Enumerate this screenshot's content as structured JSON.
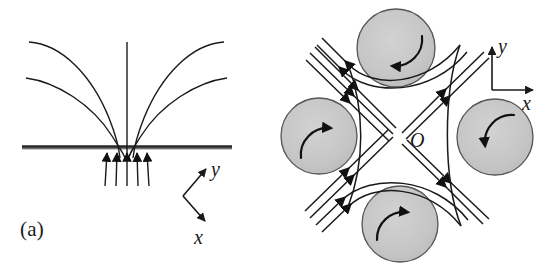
{
  "figure": {
    "panels": [
      {
        "id": "a",
        "caption": "(a)",
        "description": "Converging field lines onto a planar surface",
        "axes": {
          "y_label": "y",
          "x_label": "x",
          "style": "oblique",
          "origin_px": [
            183,
            196
          ],
          "y_tip_px": [
            206,
            168
          ],
          "x_tip_px": [
            206,
            222
          ]
        },
        "surface": {
          "name": "boundary-surface",
          "y_px": 148,
          "x_start_px": 22,
          "x_end_px": 232,
          "color": "#4a4a4a"
        },
        "line_count": 5,
        "arrow_count": 5
      },
      {
        "id": "b",
        "caption": "(b)",
        "description": "Hyperbolic stagnation-point flow between four rotating cylinders",
        "origin_label": "O",
        "origin_px": [
          383,
          140
        ],
        "axes": {
          "y_label": "y",
          "x_label": "x",
          "style": "orthogonal",
          "corner_px": [
            492,
            90
          ],
          "y_tip_px": [
            492,
            46
          ],
          "x_tip_px": [
            534,
            90
          ]
        },
        "cylinders": [
          {
            "name": "top",
            "cx": 396,
            "cy": 48,
            "r": 39,
            "rotation": "counterclockwise"
          },
          {
            "name": "left",
            "cx": 319,
            "cy": 136,
            "r": 38,
            "rotation": "counterclockwise"
          },
          {
            "name": "right",
            "cx": 495,
            "cy": 137,
            "r": 38,
            "rotation": "counterclockwise"
          },
          {
            "name": "bottom",
            "cx": 400,
            "cy": 224,
            "r": 38,
            "rotation": "counterclockwise"
          }
        ],
        "cylinder_fill": "#c8c8c8",
        "cylinder_stroke": "#555555",
        "streamline_count": 10,
        "flow": {
          "inflow": [
            "upper-left",
            "lower-left"
          ],
          "outflow": [
            "upper-right",
            "lower-right"
          ]
        }
      }
    ],
    "colors": {
      "background": "#ffffff",
      "ink": "#1a1a1a",
      "shading": "#c8c8c8",
      "surface": "#4a4a4a"
    }
  }
}
